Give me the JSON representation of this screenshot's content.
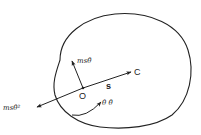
{
  "figure": {
    "labels": {
      "point_o": "O",
      "point_c": "C",
      "distance": "s",
      "tangential_force": "msθ̈",
      "centripetal_force": "msθ̇²",
      "rotation": "θ̇ θ̈"
    },
    "colors": {
      "stroke": "#222222",
      "background": "#ffffff"
    }
  }
}
